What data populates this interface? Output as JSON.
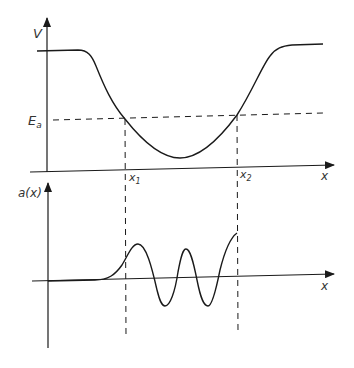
{
  "figure": {
    "top_panel": {
      "y_axis_label": "V",
      "x_axis_label": "x",
      "energy_level_label": "E",
      "energy_level_subscript": "a",
      "turning_point_1_label": "x",
      "turning_point_1_subscript": "1",
      "turning_point_2_label": "x",
      "turning_point_2_subscript": "2",
      "curve_description": "potential well V(x): high plateau left, dips to minimum between x1 and x2, high plateau right"
    },
    "bottom_panel": {
      "y_axis_label": "a(x)",
      "x_axis_label": "x",
      "curve_description": "wavefunction: exponentially small left of x1, oscillates between x1 and x2 (2 full oscillations), truncated at x2"
    },
    "colors": {
      "line": "#1a1a1a",
      "text": "#333333",
      "background": "#ffffff"
    }
  }
}
